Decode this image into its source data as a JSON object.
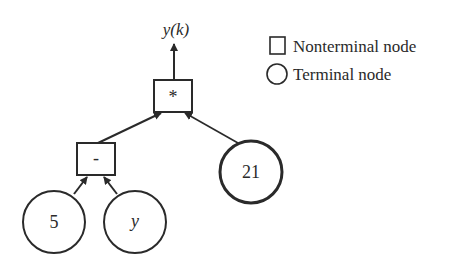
{
  "diagram": {
    "type": "expression-tree",
    "output": {
      "label": "y(k)"
    },
    "nodes": [
      {
        "id": "mult",
        "kind": "nonterminal",
        "label": "*"
      },
      {
        "id": "minus",
        "kind": "nonterminal",
        "label": "-"
      },
      {
        "id": "const21",
        "kind": "terminal",
        "label": "21"
      },
      {
        "id": "const5",
        "kind": "terminal",
        "label": "5"
      },
      {
        "id": "vary",
        "kind": "terminal",
        "label": "y"
      }
    ],
    "edges": [
      {
        "from": "mult",
        "to": "output"
      },
      {
        "from": "minus",
        "to": "mult"
      },
      {
        "from": "const21",
        "to": "mult"
      },
      {
        "from": "const5",
        "to": "minus"
      },
      {
        "from": "vary",
        "to": "minus"
      }
    ]
  },
  "legend": {
    "items": [
      {
        "shape": "square",
        "label": "Nonterminal node"
      },
      {
        "shape": "circle",
        "label": "Terminal node"
      }
    ]
  },
  "colors": {
    "stroke": "#2a2a2a",
    "background": "#ffffff"
  }
}
